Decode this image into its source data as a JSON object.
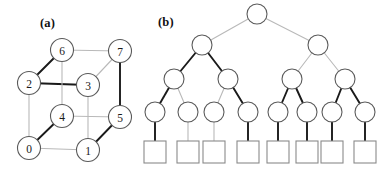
{
  "figure": {
    "width": 391,
    "height": 171,
    "background": "#ffffff",
    "panels": [
      {
        "key": "a",
        "label": "(a)",
        "caption_text": "(a)",
        "x": 40,
        "y": 16,
        "content": "hypercube-graph"
      },
      {
        "key": "b",
        "label": "(b)",
        "caption_text": "(b)",
        "x": 158,
        "y": 15,
        "content": "binary-tree"
      }
    ]
  },
  "colors": {
    "bold_edge": "#1a1a1a",
    "light_edge": "#b9b9b9",
    "node_stroke": "#5a5a5a",
    "node_fill": "#ffffff",
    "leaf_stroke": "#8a8a8a",
    "text": "#1a1a1a",
    "background": "#ffffff"
  },
  "chart_data": {
    "type": "diagram",
    "title": "",
    "panels": [
      {
        "id": "a",
        "label": "(a)",
        "kind": "graph",
        "description": "3-dimensional hypercube (cube) graph with 8 labelled vertices and a highlighted spanning subgraph",
        "node_radius": 11.5,
        "nodes": [
          {
            "id": "0",
            "label": "0",
            "x": 29,
            "y": 148
          },
          {
            "id": "1",
            "label": "1",
            "x": 88,
            "y": 150
          },
          {
            "id": "2",
            "label": "2",
            "x": 29,
            "y": 83
          },
          {
            "id": "3",
            "label": "3",
            "x": 88,
            "y": 85
          },
          {
            "id": "4",
            "label": "4",
            "x": 62,
            "y": 116
          },
          {
            "id": "5",
            "label": "5",
            "x": 120,
            "y": 117
          },
          {
            "id": "6",
            "label": "6",
            "x": 62,
            "y": 50
          },
          {
            "id": "7",
            "label": "7",
            "x": 120,
            "y": 51
          }
        ],
        "edges": [
          {
            "from": "2",
            "to": "6",
            "style": "bold"
          },
          {
            "from": "2",
            "to": "3",
            "style": "bold"
          },
          {
            "from": "0",
            "to": "4",
            "style": "bold"
          },
          {
            "from": "1",
            "to": "5",
            "style": "bold"
          },
          {
            "from": "7",
            "to": "5",
            "style": "bold"
          },
          {
            "from": "6",
            "to": "7",
            "style": "light"
          },
          {
            "from": "6",
            "to": "4",
            "style": "light"
          },
          {
            "from": "7",
            "to": "3",
            "style": "light"
          },
          {
            "from": "3",
            "to": "1",
            "style": "light"
          },
          {
            "from": "2",
            "to": "0",
            "style": "light"
          },
          {
            "from": "4",
            "to": "5",
            "style": "light"
          },
          {
            "from": "0",
            "to": "1",
            "style": "light"
          }
        ]
      },
      {
        "id": "b",
        "label": "(b)",
        "kind": "tree",
        "description": "Binary tree of depth 4: root, 2 internal, 4 internal, 8 internal circles, 8 square leaves",
        "node_radius": 10,
        "leaf_size": 22,
        "levels": [
          {
            "level": 0,
            "shape": "circle",
            "y": 14,
            "count": 1
          },
          {
            "level": 1,
            "shape": "circle",
            "y": 45,
            "count": 2
          },
          {
            "level": 2,
            "shape": "circle",
            "y": 78,
            "count": 4
          },
          {
            "level": 3,
            "shape": "circle",
            "y": 112,
            "count": 8
          },
          {
            "level": 4,
            "shape": "square",
            "y": 152,
            "count": 8
          }
        ],
        "nodes": [
          {
            "id": "r",
            "shape": "circle",
            "x": 257,
            "y": 14
          },
          {
            "id": "l1a",
            "shape": "circle",
            "x": 202,
            "y": 45
          },
          {
            "id": "l1b",
            "shape": "circle",
            "x": 318,
            "y": 45
          },
          {
            "id": "l2a",
            "shape": "circle",
            "x": 174,
            "y": 79
          },
          {
            "id": "l2b",
            "shape": "circle",
            "x": 228,
            "y": 79
          },
          {
            "id": "l2c",
            "shape": "circle",
            "x": 292,
            "y": 79
          },
          {
            "id": "l2d",
            "shape": "circle",
            "x": 345,
            "y": 79
          },
          {
            "id": "l3a",
            "shape": "circle",
            "x": 155,
            "y": 112
          },
          {
            "id": "l3b",
            "shape": "circle",
            "x": 188,
            "y": 112
          },
          {
            "id": "l3c",
            "shape": "circle",
            "x": 214,
            "y": 112
          },
          {
            "id": "l3d",
            "shape": "circle",
            "x": 248,
            "y": 112
          },
          {
            "id": "l3e",
            "shape": "circle",
            "x": 278,
            "y": 112
          },
          {
            "id": "l3f",
            "shape": "circle",
            "x": 307,
            "y": 112
          },
          {
            "id": "l3g",
            "shape": "circle",
            "x": 332,
            "y": 112
          },
          {
            "id": "l3h",
            "shape": "circle",
            "x": 365,
            "y": 112
          },
          {
            "id": "leaf1",
            "shape": "square",
            "x": 155,
            "y": 152
          },
          {
            "id": "leaf2",
            "shape": "square",
            "x": 188,
            "y": 152
          },
          {
            "id": "leaf3",
            "shape": "square",
            "x": 214,
            "y": 152
          },
          {
            "id": "leaf4",
            "shape": "square",
            "x": 248,
            "y": 152
          },
          {
            "id": "leaf5",
            "shape": "square",
            "x": 278,
            "y": 152
          },
          {
            "id": "leaf6",
            "shape": "square",
            "x": 307,
            "y": 152
          },
          {
            "id": "leaf7",
            "shape": "square",
            "x": 332,
            "y": 152
          },
          {
            "id": "leaf8",
            "shape": "square",
            "x": 365,
            "y": 152
          }
        ],
        "edges": [
          {
            "from": "r",
            "to": "l1a",
            "style": "light"
          },
          {
            "from": "r",
            "to": "l1b",
            "style": "light"
          },
          {
            "from": "l1a",
            "to": "l2a",
            "style": "bold"
          },
          {
            "from": "l1a",
            "to": "l2b",
            "style": "bold"
          },
          {
            "from": "l1b",
            "to": "l2c",
            "style": "light"
          },
          {
            "from": "l1b",
            "to": "l2d",
            "style": "light"
          },
          {
            "from": "l2a",
            "to": "l3a",
            "style": "bold"
          },
          {
            "from": "l2a",
            "to": "l3b",
            "style": "light"
          },
          {
            "from": "l2b",
            "to": "l3c",
            "style": "light"
          },
          {
            "from": "l2b",
            "to": "l3d",
            "style": "bold"
          },
          {
            "from": "l2c",
            "to": "l3e",
            "style": "bold"
          },
          {
            "from": "l2c",
            "to": "l3f",
            "style": "bold"
          },
          {
            "from": "l2d",
            "to": "l3g",
            "style": "bold"
          },
          {
            "from": "l2d",
            "to": "l3h",
            "style": "bold"
          },
          {
            "from": "l3a",
            "to": "leaf1",
            "style": "bold"
          },
          {
            "from": "l3b",
            "to": "leaf2",
            "style": "light"
          },
          {
            "from": "l3c",
            "to": "leaf3",
            "style": "light"
          },
          {
            "from": "l3d",
            "to": "leaf4",
            "style": "bold"
          },
          {
            "from": "l3e",
            "to": "leaf5",
            "style": "bold"
          },
          {
            "from": "l3f",
            "to": "leaf6",
            "style": "bold"
          },
          {
            "from": "l3g",
            "to": "leaf7",
            "style": "bold"
          },
          {
            "from": "l3h",
            "to": "leaf8",
            "style": "bold"
          }
        ]
      }
    ]
  }
}
